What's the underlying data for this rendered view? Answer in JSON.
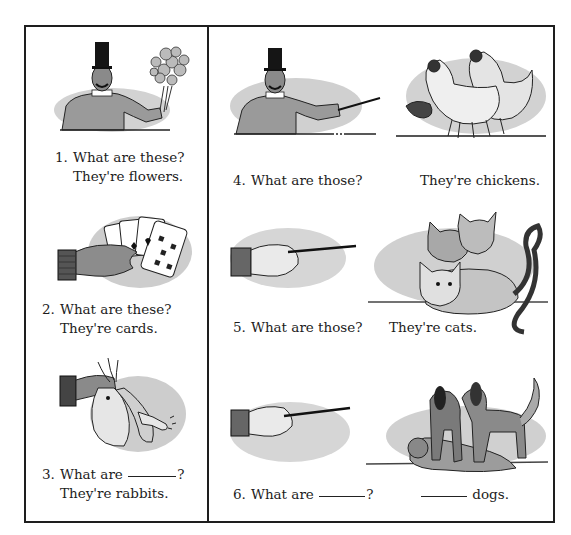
{
  "exercise": {
    "items": [
      {
        "number": "1.",
        "question": "What are these?",
        "answer": "They're flowers.",
        "image": "man-holding-flowers"
      },
      {
        "number": "2.",
        "question": "What are these?",
        "answer": "They're cards.",
        "image": "hand-holding-cards"
      },
      {
        "number": "3.",
        "question_prefix": "What are",
        "question_suffix": "?",
        "answer": "They're rabbits.",
        "image": "hand-holding-rabbits"
      },
      {
        "number": "4.",
        "question": "What are those?",
        "answer": "They're chickens.",
        "image": "man-pointing-at-chickens"
      },
      {
        "number": "5.",
        "question": "What are those?",
        "answer": "They're cats.",
        "image": "hand-pointing-at-cats"
      },
      {
        "number": "6.",
        "question_prefix": "What are",
        "question_suffix": "?",
        "answer_suffix": "dogs.",
        "image": "hand-pointing-at-dogs"
      }
    ]
  },
  "colors": {
    "ink": "#1e1e1e",
    "wash": "#c8c8c8",
    "paper": "#ffffff"
  }
}
